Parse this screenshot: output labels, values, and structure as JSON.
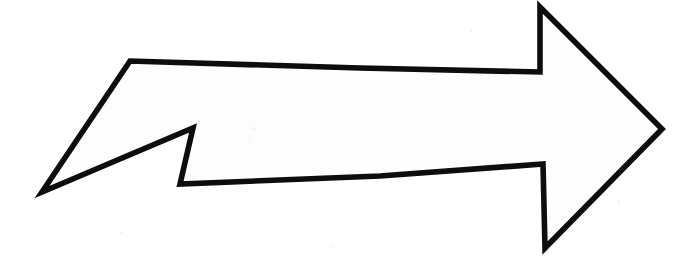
{
  "image": {
    "kind": "scanned-hand-drawn-sketch",
    "subject": "right-pointing arrow outline",
    "caption": "Hand-drawn black outline of a right-pointing arrow with a notched tail on a white paper background",
    "width": 699,
    "height": 268,
    "orientation": "points right"
  },
  "colors": {
    "background": "#ffffff",
    "paper_fill": "#fdfdfd",
    "ink": "#0d0d0d",
    "speck": "#f2f2f2"
  },
  "stroke": {
    "width": 5.6,
    "linejoin": "miter",
    "linecap": "round"
  },
  "shape": {
    "name": "arrow-outline",
    "closed": true,
    "vertices": [
      {
        "label": "tail-notch-tip",
        "x": 42,
        "y": 192
      },
      {
        "label": "tail-top-left-corner",
        "x": 130,
        "y": 61
      },
      {
        "label": "shaft-top-mid",
        "x": 360,
        "y": 68
      },
      {
        "label": "shaft-top-right",
        "x": 540,
        "y": 72
      },
      {
        "label": "barb-top-apex",
        "x": 540,
        "y": 7
      },
      {
        "label": "arrow-point-right-tip",
        "x": 662,
        "y": 129
      },
      {
        "label": "barb-bottom-apex",
        "x": 545,
        "y": 248
      },
      {
        "label": "shaft-bottom-right",
        "x": 543,
        "y": 164
      },
      {
        "label": "shaft-bottom-mid",
        "x": 380,
        "y": 176
      },
      {
        "label": "tail-bottom-left",
        "x": 180,
        "y": 184
      },
      {
        "label": "tail-inner-notch",
        "x": 193,
        "y": 128
      }
    ],
    "path": "M 42 192 L 130 61 L 360 68 L 540 72 L 540 7 L 662 129 L 545 248 L 543 164 L 380 176 L 180 184 L 193 128 Z"
  },
  "specks": [
    {
      "x": 252,
      "y": 127,
      "size": 3
    },
    {
      "x": 248,
      "y": 137,
      "size": 2
    },
    {
      "x": 470,
      "y": 30,
      "size": 3
    },
    {
      "x": 617,
      "y": 200,
      "size": 3
    },
    {
      "x": 120,
      "y": 232,
      "size": 2
    },
    {
      "x": 330,
      "y": 246,
      "size": 2
    }
  ]
}
